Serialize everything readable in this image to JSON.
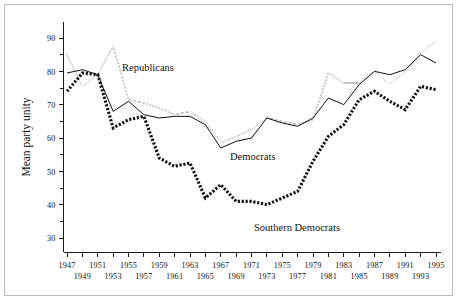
{
  "figure": {
    "background": "#ffffff",
    "frame_color": "#b9b9b9",
    "ink_color": "#111111"
  },
  "chart_data": {
    "type": "line",
    "title": "",
    "xlabel": "",
    "ylabel": "Mean party unity",
    "xlim": [
      1947,
      1995
    ],
    "ylim": [
      28,
      93
    ],
    "y_ticks_major": [
      30,
      40,
      50,
      60,
      70,
      80,
      90
    ],
    "y_ticks_minor": [
      35,
      45,
      55,
      65,
      75,
      85
    ],
    "x_ticks": [
      1947,
      1949,
      1951,
      1953,
      1955,
      1957,
      1959,
      1961,
      1963,
      1965,
      1967,
      1969,
      1971,
      1973,
      1975,
      1977,
      1979,
      1981,
      1983,
      1985,
      1987,
      1989,
      1991,
      1993,
      1995
    ],
    "x_tick_labels_top_row": [
      "1947",
      "1951",
      "1955",
      "1959",
      "1963",
      "1967",
      "1971",
      "1975",
      "1979",
      "1983",
      "1987",
      "1991",
      "1995"
    ],
    "x_tick_labels_bottom_row": [
      "1949",
      "1953",
      "1957",
      "1961",
      "1965",
      "1969",
      "1973",
      "1977",
      "1981",
      "1985",
      "1989",
      "1993"
    ],
    "grid": false,
    "legend_position": "inline-annotations",
    "x": [
      1947,
      1949,
      1951,
      1953,
      1955,
      1957,
      1959,
      1961,
      1963,
      1965,
      1967,
      1969,
      1971,
      1973,
      1975,
      1977,
      1979,
      1981,
      1983,
      1985,
      1987,
      1989,
      1991,
      1993,
      1995
    ],
    "series": [
      {
        "name": "Republicans",
        "style": "double-open-line",
        "values": [
          85,
          75.5,
          79,
          87.5,
          71.5,
          70.5,
          69,
          67,
          68,
          65,
          58.5,
          60.5,
          62.5,
          66,
          65,
          64,
          65.5,
          79.5,
          76.5,
          76.5,
          80,
          76,
          80,
          85.5,
          89
        ]
      },
      {
        "name": "Democrats",
        "style": "solid-thick-line",
        "values": [
          79.5,
          80.5,
          79,
          68,
          71,
          67,
          66,
          66.5,
          66.5,
          64,
          57,
          59,
          60,
          66,
          64.5,
          63.5,
          66,
          72,
          70,
          76,
          80,
          79,
          80.5,
          85,
          82.5
        ]
      },
      {
        "name": "Southern Democrats",
        "style": "dotted-thick-line",
        "values": [
          74,
          79.5,
          79,
          63,
          65.5,
          66.5,
          54,
          51.5,
          52.5,
          42,
          46,
          41,
          41,
          40,
          42,
          44,
          53,
          60.5,
          64,
          71.5,
          74,
          71,
          68.5,
          75.5,
          74.5
        ]
      }
    ],
    "annotations": [
      {
        "text": "Republicans",
        "x_px": 122,
        "y_px": 71
      },
      {
        "text": "Democrats",
        "x_px": 230,
        "y_px": 160
      },
      {
        "text": "Southern Democrats",
        "x_px": 254,
        "y_px": 231
      }
    ]
  }
}
